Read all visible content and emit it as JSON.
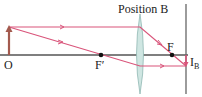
{
  "diagram": {
    "title": "Position B",
    "labels": {
      "object": "O",
      "focal_left": "F′",
      "focal_right": "F",
      "image_main": "I",
      "image_sub": "B"
    },
    "colors": {
      "ray": "#d9547a",
      "axis": "#555555",
      "object_arrow": "#a35a4e",
      "lens_fill": "#cfe6e2",
      "lens_stroke": "#8fb8b2",
      "screen": "#666666",
      "point": "#111111"
    },
    "elements": {
      "object_arrow": "upright object arrow at O",
      "lens": "converging lens at Position B",
      "screen": "vertical screen where image forms",
      "image_arrow": "inverted image I_B on screen"
    }
  }
}
